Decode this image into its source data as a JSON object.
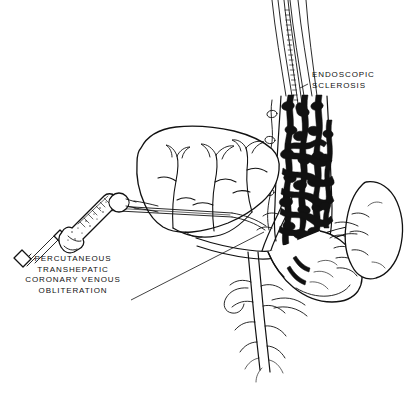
{
  "figure": {
    "background_color": "#ffffff",
    "ink_color": "#111111",
    "width": 409,
    "height": 406
  },
  "labels": {
    "endoscopic": {
      "line1": "ENDOSCOPIC",
      "line2": "SCLEROSIS"
    },
    "percutaneous": {
      "line1": "PERCUTANEOUS",
      "line2": "TRANSHEPATIC",
      "line3": "CORONARY  VENOUS",
      "line4": "OBLITERATION"
    }
  },
  "anatomy": {
    "liver": "liver",
    "spleen": "spleen",
    "stomach": "stomach",
    "esophagus": "esophagus",
    "esophageal_varices": "esophageal varices",
    "portal_vein": "portal vein",
    "splenic_vein": "splenic vein",
    "coronary_vein": "coronary (left gastric) vein",
    "short_gastric_veins": "short gastric veins",
    "superior_mesenteric_vein": "superior mesenteric vein"
  },
  "instruments": {
    "endoscope": "endoscope",
    "sclerotherapy_needle": "sclerotherapy injection needle",
    "syringe": "syringe",
    "transhepatic_catheter": "transhepatic catheter needle"
  }
}
